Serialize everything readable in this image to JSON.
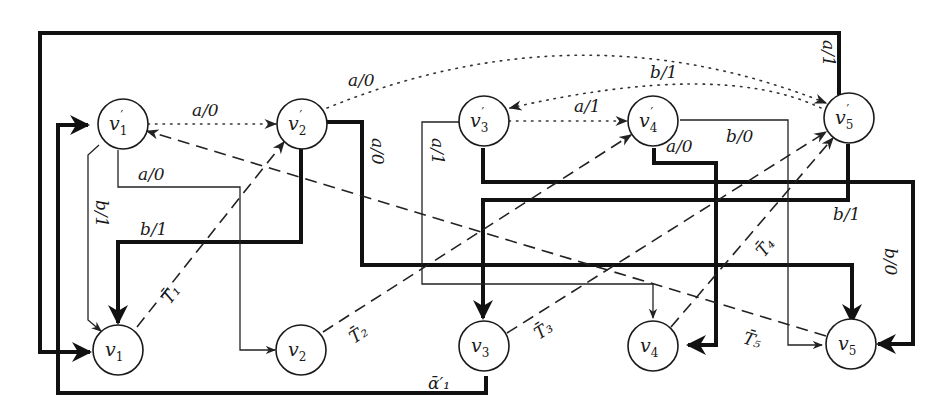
{
  "diagram": {
    "type": "state-transition graph",
    "nodes": [
      {
        "id": "v1p",
        "base": "v",
        "sub": "1",
        "prime": true
      },
      {
        "id": "v2p",
        "base": "v",
        "sub": "2",
        "prime": true
      },
      {
        "id": "v3p",
        "base": "v",
        "sub": "3",
        "prime": true
      },
      {
        "id": "v4p",
        "base": "v",
        "sub": "4",
        "prime": true
      },
      {
        "id": "v5p",
        "base": "v",
        "sub": "5",
        "prime": true
      },
      {
        "id": "v1",
        "base": "v",
        "sub": "1",
        "prime": false
      },
      {
        "id": "v2",
        "base": "v",
        "sub": "2",
        "prime": false
      },
      {
        "id": "v3",
        "base": "v",
        "sub": "3",
        "prime": false
      },
      {
        "id": "v4",
        "base": "v",
        "sub": "4",
        "prime": false
      },
      {
        "id": "v5",
        "base": "v",
        "sub": "5",
        "prime": false
      }
    ],
    "edge_labels": {
      "v1p_v2p_dotted": "a/0",
      "v2p_v5p_dotted": "a/0",
      "v3p_v4p_dotted": "a/1",
      "v5p_v3p_dotted": "b/1",
      "v1p_v2_thin": "a/0",
      "v1p_v1_thin": "b/1",
      "v2p_v1_thick": "b/1",
      "v2p_v5_thick": "a/0",
      "v3p_v4_thin": "a/1",
      "v4p_v4_thick": "a/0",
      "v4p_v5_thin": "b/0",
      "v5p_v1_thick": "a/1",
      "v5p_v3_thick": "b/1",
      "v3p_v5_thick": "b/0",
      "v3_v1p_thick": "ᾱ′₁"
    },
    "dashed_labels": {
      "T1": "T̄₁",
      "T2": "T̄₂",
      "T3": "T̄₃",
      "T4": "T̄₄",
      "T5": "T̄₅"
    },
    "prime_mark": "′",
    "colors": {
      "stroke": "#111111",
      "background": "#ffffff"
    }
  }
}
